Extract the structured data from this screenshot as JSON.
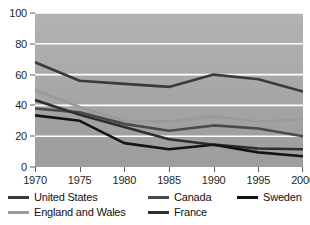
{
  "chart_data": {
    "type": "line",
    "title": "",
    "xlabel": "",
    "ylabel": "",
    "categories": [
      "1970",
      "1975",
      "1980",
      "1985",
      "1990",
      "1995",
      "2000"
    ],
    "x": [
      1970,
      1975,
      1980,
      1985,
      1990,
      1995,
      2000
    ],
    "xlim": [
      1970,
      2000
    ],
    "ylim": [
      0,
      100
    ],
    "yticks": [
      0,
      20,
      40,
      60,
      80,
      100
    ],
    "grid": true,
    "grid_color": "#ffffff",
    "plot_background": "#a9a9a9",
    "legend_position": "bottom",
    "series": [
      {
        "name": "United States",
        "color": "#3a3a3a",
        "values": [
          68,
          56,
          54,
          52,
          60,
          57,
          49
        ]
      },
      {
        "name": "Canada",
        "color": "#4a4a4a",
        "values": [
          38,
          35.5,
          28,
          23.5,
          27,
          25,
          20
        ]
      },
      {
        "name": "Sweden",
        "color": "#141414",
        "values": [
          33.5,
          30,
          15.5,
          11.5,
          14.5,
          9.5,
          7
        ]
      },
      {
        "name": "England and Wales",
        "color": "#9a9a9a",
        "values": [
          50,
          39,
          30,
          29.5,
          33,
          29.5,
          31
        ]
      },
      {
        "name": "France",
        "color": "#2e2e2e",
        "values": [
          43.5,
          34,
          26,
          18,
          14.5,
          12,
          11.5
        ]
      }
    ]
  },
  "legend": {
    "rows": [
      [
        {
          "label": "United States",
          "color": "#3a3a3a",
          "left": 0
        },
        {
          "label": "Canada",
          "color": "#4a4a4a",
          "left": 140
        },
        {
          "label": "Sweden",
          "color": "#141414",
          "left": 229
        }
      ],
      [
        {
          "label": "England and Wales",
          "color": "#9a9a9a",
          "left": 0
        },
        {
          "label": "France",
          "color": "#2e2e2e",
          "left": 140
        }
      ]
    ]
  }
}
